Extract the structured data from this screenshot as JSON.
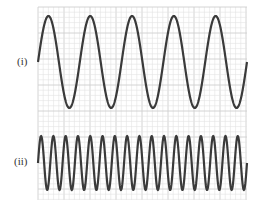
{
  "figure": {
    "grid": {
      "x0": 38,
      "y0": 7,
      "x1": 247,
      "y1": 200,
      "minor_step": 5.2,
      "major_every": 5,
      "minor_color": "#e2e2e2",
      "major_color": "#cfcfcf"
    },
    "waves": [
      {
        "label": "(i)",
        "cycles": 5,
        "center_y": 62,
        "amplitude": 46,
        "phase": "rising-from-midline",
        "color": "#3a3a3a",
        "stroke_width": 2.2
      },
      {
        "label": "(ii)",
        "cycles": 17,
        "center_y": 163,
        "amplitude": 27,
        "phase": "rising-from-midline",
        "color": "#3a3a3a",
        "stroke_width": 2.2
      }
    ]
  }
}
